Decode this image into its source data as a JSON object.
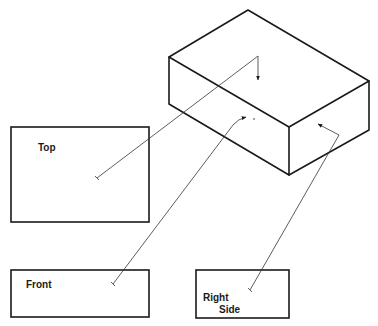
{
  "diagram": {
    "type": "orthographic-projection",
    "colors": {
      "line": "#1a1a1a",
      "leader": "#333333",
      "background": "#ffffff"
    },
    "isometric_box": {
      "vertices": {
        "top_back": [
          248,
          10
        ],
        "top_left": [
          169,
          57
        ],
        "top_right": [
          369,
          81
        ],
        "top_front": [
          289,
          127
        ],
        "bottom_left": [
          169,
          104
        ],
        "bottom_front": [
          289,
          175
        ],
        "bottom_right": [
          369,
          130
        ]
      }
    },
    "views": [
      {
        "id": "top",
        "label_lines": [
          "Top"
        ],
        "rect": [
          11,
          127,
          138,
          95
        ]
      },
      {
        "id": "front",
        "label_lines": [
          "Front"
        ],
        "rect": [
          11,
          270,
          138,
          47
        ]
      },
      {
        "id": "right-side",
        "label_lines": [
          "Right",
          "Side"
        ],
        "rect": [
          196,
          270,
          93,
          48
        ]
      }
    ],
    "labels": {
      "top": "Top",
      "front": "Front",
      "right_line1": "Right",
      "right_line2": "Side"
    }
  }
}
